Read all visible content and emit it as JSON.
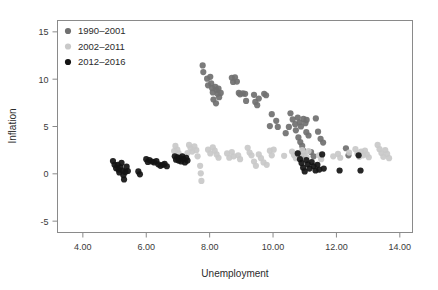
{
  "chart_data": {
    "type": "scatter",
    "title": "",
    "xlabel": "Unemployment",
    "ylabel": "Inflation",
    "xlim": [
      3.2,
      14.4
    ],
    "ylim": [
      -6.2,
      16.2
    ],
    "xticks": [
      "4.00",
      "6.00",
      "8.00",
      "10.00",
      "12.00",
      "14.00"
    ],
    "xtick_values": [
      4,
      6,
      8,
      10,
      12,
      14
    ],
    "yticks": [
      "-5",
      "0",
      "5",
      "10",
      "15"
    ],
    "ytick_values": [
      -5,
      0,
      5,
      10,
      15
    ],
    "grid": false,
    "legend_position": "top-left",
    "legend": [
      {
        "label": "1990–2001",
        "color": "#707070"
      },
      {
        "label": "2002–2011",
        "color": "#c9c9c9"
      },
      {
        "label": "2012–2016",
        "color": "#141414"
      }
    ],
    "marker_radius": 3.1,
    "series": [
      {
        "name": "1990–2001",
        "color": "#707070",
        "points": [
          [
            7.78,
            11.45
          ],
          [
            7.8,
            10.75
          ],
          [
            7.92,
            10.05
          ],
          [
            7.95,
            9.35
          ],
          [
            8.02,
            10.25
          ],
          [
            8.05,
            9.55
          ],
          [
            8.08,
            9.05
          ],
          [
            8.1,
            8.6
          ],
          [
            8.18,
            9.2
          ],
          [
            8.22,
            8.85
          ],
          [
            8.25,
            8.45
          ],
          [
            8.28,
            9.0
          ],
          [
            8.12,
            7.85
          ],
          [
            8.2,
            7.45
          ],
          [
            8.3,
            8.1
          ],
          [
            8.35,
            8.55
          ],
          [
            8.7,
            10.15
          ],
          [
            8.74,
            9.7
          ],
          [
            8.8,
            10.2
          ],
          [
            8.86,
            9.75
          ],
          [
            8.92,
            8.55
          ],
          [
            8.96,
            8.4
          ],
          [
            9.05,
            8.5
          ],
          [
            9.12,
            8.45
          ],
          [
            9.15,
            7.7
          ],
          [
            9.4,
            8.35
          ],
          [
            9.44,
            7.6
          ],
          [
            9.5,
            7.25
          ],
          [
            9.55,
            7.95
          ],
          [
            9.72,
            8.45
          ],
          [
            9.78,
            8.3
          ],
          [
            9.96,
            6.3
          ],
          [
            10.1,
            5.6
          ],
          [
            10.15,
            4.95
          ],
          [
            10.55,
            6.4
          ],
          [
            10.62,
            5.75
          ],
          [
            10.7,
            5.25
          ],
          [
            10.72,
            4.6
          ],
          [
            10.78,
            5.95
          ],
          [
            10.84,
            5.45
          ],
          [
            10.88,
            5.0
          ],
          [
            10.96,
            5.8
          ],
          [
            11.02,
            5.35
          ],
          [
            11.06,
            5.7
          ],
          [
            10.8,
            3.85
          ],
          [
            10.86,
            3.35
          ],
          [
            10.92,
            2.95
          ],
          [
            10.95,
            2.45
          ],
          [
            10.98,
            1.95
          ],
          [
            11.05,
            4.4
          ],
          [
            11.12,
            4.05
          ],
          [
            11.35,
            5.85
          ],
          [
            11.42,
            4.45
          ],
          [
            11.5,
            3.7
          ],
          [
            11.58,
            3.3
          ],
          [
            10.5,
            4.95
          ],
          [
            10.4,
            4.3
          ],
          [
            12.3,
            2.7
          ],
          [
            12.38,
            1.95
          ],
          [
            9.9,
            5.05
          ],
          [
            11.2,
            2.3
          ],
          [
            11.28,
            1.85
          ]
        ]
      },
      {
        "name": "2002–2011",
        "color": "#c9c9c9",
        "points": [
          [
            6.92,
            2.95
          ],
          [
            6.98,
            2.55
          ],
          [
            7.02,
            2.2
          ],
          [
            7.1,
            1.85
          ],
          [
            7.35,
            3.05
          ],
          [
            7.4,
            2.7
          ],
          [
            7.45,
            2.35
          ],
          [
            7.52,
            2.9
          ],
          [
            7.58,
            2.5
          ],
          [
            7.62,
            1.85
          ],
          [
            7.7,
            0.85
          ],
          [
            7.72,
            0.05
          ],
          [
            7.74,
            -0.75
          ],
          [
            7.95,
            2.55
          ],
          [
            8.02,
            2.15
          ],
          [
            8.1,
            2.8
          ],
          [
            8.16,
            2.45
          ],
          [
            8.22,
            2.05
          ],
          [
            8.28,
            1.7
          ],
          [
            8.55,
            2.15
          ],
          [
            8.62,
            1.7
          ],
          [
            8.7,
            2.3
          ],
          [
            8.76,
            1.85
          ],
          [
            8.9,
            1.95
          ],
          [
            8.96,
            1.55
          ],
          [
            9.2,
            2.75
          ],
          [
            9.26,
            2.25
          ],
          [
            9.32,
            1.95
          ],
          [
            9.4,
            1.3
          ],
          [
            9.46,
            0.85
          ],
          [
            9.55,
            2.05
          ],
          [
            9.62,
            1.65
          ],
          [
            9.7,
            1.2
          ],
          [
            9.9,
            2.45
          ],
          [
            9.96,
            1.95
          ],
          [
            10.02,
            2.55
          ],
          [
            10.6,
            2.35
          ],
          [
            10.66,
            2.0
          ],
          [
            10.72,
            1.65
          ],
          [
            10.8,
            2.2
          ],
          [
            10.86,
            1.8
          ],
          [
            10.92,
            2.5
          ],
          [
            11.0,
            2.15
          ],
          [
            11.06,
            1.75
          ],
          [
            11.12,
            2.4
          ],
          [
            11.45,
            1.95
          ],
          [
            11.52,
            1.55
          ],
          [
            12.05,
            2.1
          ],
          [
            12.12,
            1.7
          ],
          [
            12.6,
            2.6
          ],
          [
            12.66,
            2.15
          ],
          [
            12.72,
            1.8
          ],
          [
            12.78,
            2.35
          ],
          [
            12.84,
            1.95
          ],
          [
            12.9,
            2.45
          ],
          [
            12.96,
            2.05
          ],
          [
            13.02,
            1.75
          ],
          [
            13.3,
            3.05
          ],
          [
            13.36,
            2.6
          ],
          [
            13.42,
            2.2
          ],
          [
            13.48,
            1.8
          ],
          [
            13.54,
            2.5
          ],
          [
            13.6,
            2.1
          ],
          [
            13.66,
            1.65
          ],
          [
            11.9,
            1.85
          ],
          [
            12.4,
            2.25
          ],
          [
            10.35,
            1.9
          ],
          [
            9.8,
            0.95
          ],
          [
            6.88,
            2.4
          ],
          [
            7.05,
            1.45
          ],
          [
            7.3,
            2.2
          ]
        ]
      },
      {
        "name": "2012–2016",
        "color": "#141414",
        "points": [
          [
            4.95,
            1.35
          ],
          [
            5.0,
            0.95
          ],
          [
            5.05,
            0.6
          ],
          [
            5.1,
            0.95
          ],
          [
            5.12,
            0.45
          ],
          [
            5.15,
            0.15
          ],
          [
            5.18,
            0.7
          ],
          [
            5.22,
            1.15
          ],
          [
            5.25,
            0.35
          ],
          [
            5.28,
            -0.15
          ],
          [
            5.3,
            -0.6
          ],
          [
            5.34,
            0.2
          ],
          [
            5.38,
            0.75
          ],
          [
            5.42,
            0.3
          ],
          [
            5.75,
            0.25
          ],
          [
            5.8,
            -0.05
          ],
          [
            6.0,
            1.55
          ],
          [
            6.05,
            1.25
          ],
          [
            6.1,
            1.45
          ],
          [
            6.18,
            1.3
          ],
          [
            6.25,
            1.2
          ],
          [
            6.32,
            1.35
          ],
          [
            6.38,
            1.0
          ],
          [
            6.45,
            0.85
          ],
          [
            6.52,
            0.95
          ],
          [
            6.58,
            1.05
          ],
          [
            6.65,
            0.8
          ],
          [
            6.9,
            1.85
          ],
          [
            6.94,
            1.5
          ],
          [
            6.98,
            1.75
          ],
          [
            7.02,
            1.4
          ],
          [
            7.06,
            1.65
          ],
          [
            7.1,
            1.3
          ],
          [
            7.14,
            1.85
          ],
          [
            7.18,
            1.55
          ],
          [
            7.22,
            1.2
          ],
          [
            7.26,
            1.7
          ],
          [
            7.3,
            1.4
          ],
          [
            10.85,
            1.55
          ],
          [
            10.9,
            1.15
          ],
          [
            10.95,
            0.65
          ],
          [
            11.0,
            0.25
          ],
          [
            11.05,
            1.45
          ],
          [
            11.1,
            1.0
          ],
          [
            11.15,
            0.55
          ],
          [
            11.22,
            1.25
          ],
          [
            11.28,
            0.8
          ],
          [
            11.34,
            0.35
          ],
          [
            11.4,
            0.95
          ],
          [
            11.46,
            0.45
          ],
          [
            11.6,
            0.55
          ],
          [
            12.1,
            0.35
          ],
          [
            12.7,
            1.95
          ],
          [
            12.76,
            0.35
          ],
          [
            11.55,
            2.05
          ],
          [
            10.78,
            2.15
          ]
        ]
      }
    ]
  },
  "legend_markers": {
    "series_1_color": "#707070",
    "series_2_color": "#c9c9c9",
    "series_3_color": "#141414"
  },
  "frame": {
    "stroke_color": "#8a8a8a"
  }
}
